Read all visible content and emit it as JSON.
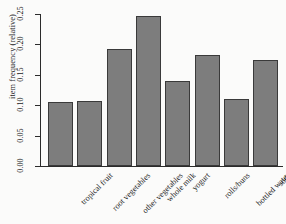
{
  "chart_data": {
    "type": "bar",
    "title": "",
    "xlabel": "",
    "ylabel": "item frequency (relative)",
    "categories": [
      "tropical fruit",
      "root vegetables",
      "other vegetables",
      "whole milk",
      "yogurt",
      "rolls/buns",
      "bottled water",
      "soda"
    ],
    "values": [
      0.105,
      0.107,
      0.193,
      0.246,
      0.139,
      0.183,
      0.111,
      0.175
    ],
    "ylim": [
      0.0,
      0.25
    ],
    "ytick_labels": [
      "0.00",
      "0.05",
      "0.10",
      "0.15",
      "0.20",
      "0.25"
    ],
    "ytick_values": [
      0.0,
      0.05,
      0.1,
      0.15,
      0.2,
      0.25
    ],
    "grid": false,
    "legend": "none",
    "bar_color": "#7d7d7d",
    "bar_border_color": "#3a3a3a",
    "axis_color": "#2b2b2b",
    "background": "#fbfbfa"
  }
}
